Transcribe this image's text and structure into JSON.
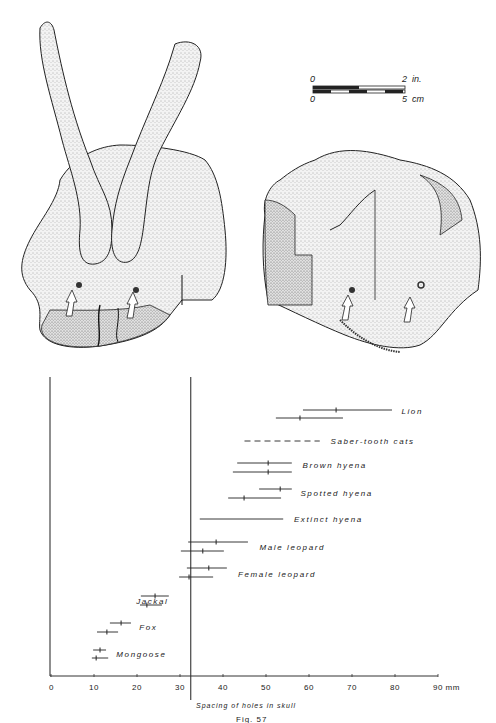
{
  "figure": {
    "caption": "Fig. 57",
    "illustrations": [
      {
        "name": "skull-fragment-left",
        "description": "Skull fragment with two antlers/horn cores, two puncture holes marked by arrows"
      },
      {
        "name": "skull-fragment-right",
        "description": "Skull fragment with two puncture holes marked by arrows"
      }
    ],
    "scale_bar": {
      "top_labels": [
        "0",
        "2  in."
      ],
      "bottom_labels": [
        "0",
        "5  cm"
      ]
    }
  },
  "chart_data": {
    "type": "range",
    "title": "",
    "xlabel": "Spacing of holes in skull",
    "x_unit": "mm",
    "xlim": [
      0,
      90
    ],
    "x_ticks": [
      0,
      10,
      20,
      30,
      40,
      50,
      60,
      70,
      80,
      90
    ],
    "x_tick_labels": [
      "0",
      "10",
      "20",
      "30",
      "40",
      "50",
      "60",
      "70",
      "80",
      "90  mm"
    ],
    "reference_line_x": 32.5,
    "grid": false,
    "legend": "none (labels placed beside each range)",
    "series": [
      {
        "name": "Lion",
        "ranges": [
          {
            "min": 58.6,
            "max": 79.3,
            "mean": 66.3
          },
          {
            "min": 52.3,
            "max": 67.9,
            "mean": 57.9
          }
        ],
        "style": "solid"
      },
      {
        "name": "Saber-tooth cats",
        "ranges": [
          {
            "min": 45.0,
            "max": 62.5,
            "mean": null
          }
        ],
        "style": "dashed"
      },
      {
        "name": "Brown hyena",
        "ranges": [
          {
            "min": 43.3,
            "max": 56.0,
            "mean": 50.5
          },
          {
            "min": 42.3,
            "max": 56.0,
            "mean": 50.5
          }
        ],
        "style": "solid"
      },
      {
        "name": "Spotted hyena",
        "ranges": [
          {
            "min": 48.4,
            "max": 56.0,
            "mean": 53.3
          },
          {
            "min": 41.2,
            "max": 53.5,
            "mean": 44.9
          }
        ],
        "style": "solid"
      },
      {
        "name": "Extinct hyena",
        "ranges": [
          {
            "min": 34.6,
            "max": 54.0,
            "mean": null
          }
        ],
        "style": "solid"
      },
      {
        "name": "Male leopard",
        "ranges": [
          {
            "min": 31.9,
            "max": 45.8,
            "mean": 38.4
          },
          {
            "min": 30.2,
            "max": 40.2,
            "mean": 35.3
          }
        ],
        "style": "solid"
      },
      {
        "name": "Female leopard",
        "ranges": [
          {
            "min": 31.6,
            "max": 40.9,
            "mean": 36.7
          },
          {
            "min": 29.8,
            "max": 37.7,
            "mean": 32.1
          }
        ],
        "style": "solid"
      },
      {
        "name": "Jackal",
        "ranges": [
          {
            "min": 20.9,
            "max": 27.4,
            "mean": 24.2
          },
          {
            "min": 20.7,
            "max": 25.8,
            "mean": 22.3
          }
        ],
        "style": "solid"
      },
      {
        "name": "Fox",
        "ranges": [
          {
            "min": 13.7,
            "max": 18.6,
            "mean": 16.3
          },
          {
            "min": 10.7,
            "max": 15.6,
            "mean": 13.0
          }
        ],
        "style": "solid"
      },
      {
        "name": "Mongoose",
        "ranges": [
          {
            "min": 9.8,
            "max": 12.8,
            "mean": 11.4
          },
          {
            "min": 9.5,
            "max": 13.3,
            "mean": 10.5
          }
        ],
        "style": "solid"
      }
    ]
  }
}
